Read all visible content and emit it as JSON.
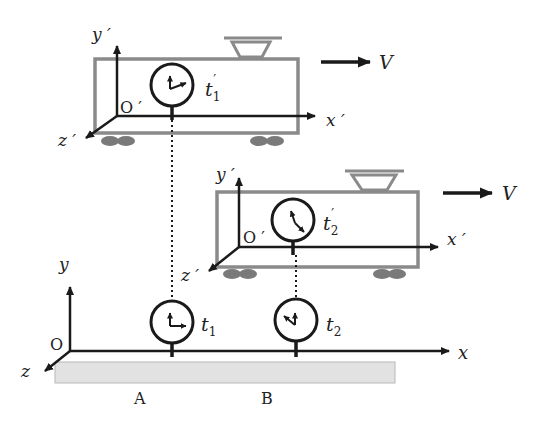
{
  "diagram": {
    "colors": {
      "train_outline": "#8a8a8a",
      "axis": "#1a1a1a",
      "wheels": "#7a7a7a",
      "ground_strip": "#e2e2e2"
    },
    "velocity_label": "V",
    "train_frame": {
      "origin_label": "O ′",
      "x_label": "x ′",
      "y_label": "y ′",
      "z_label": "z ′"
    },
    "ground_frame": {
      "origin_label": "O",
      "x_label": "x",
      "y_label": "y",
      "z_label": "z"
    },
    "trains": [
      {
        "clock_label": "t",
        "clock_sub": "1",
        "clock_prime": "′"
      },
      {
        "clock_label": "t",
        "clock_sub": "2",
        "clock_prime": "′"
      }
    ],
    "ground_clocks": [
      {
        "clock_label": "t",
        "clock_sub": "1",
        "position_label": "A"
      },
      {
        "clock_label": "t",
        "clock_sub": "2",
        "position_label": "B"
      }
    ]
  }
}
